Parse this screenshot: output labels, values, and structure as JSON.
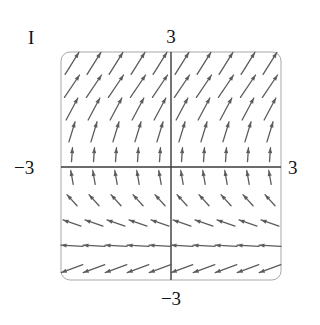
{
  "figure": {
    "title_label": "I",
    "labels": {
      "top": "3",
      "bottom": "−3",
      "left": "−3",
      "right": "3"
    },
    "frame": {
      "x": 61,
      "y": 52,
      "width": 220,
      "height": 228,
      "corner_radius": 9,
      "stroke": "#a8a8a8",
      "stroke_width": 1
    },
    "axes": {
      "x_axis_y": 167,
      "y_axis_x": 171,
      "stroke": "#3a3a3a",
      "stroke_width": 1.4
    },
    "arrow_style": {
      "stroke": "#5c5c5c",
      "stroke_width": 1.3,
      "head_length": 5.5,
      "head_width": 4.2
    }
  },
  "chart_data": {
    "type": "scatter",
    "title": "I",
    "subtype": "direction-field",
    "xlabel": "",
    "ylabel": "",
    "xlim": [
      -3,
      3
    ],
    "ylim": [
      -3,
      3
    ],
    "grid": false,
    "legend": null,
    "tick_labels": {
      "top": "3",
      "bottom": "-3",
      "left": "-3",
      "right": "3"
    },
    "grid_columns": 10,
    "grid_rows": 10,
    "x": [
      -2.7,
      -2.1,
      -1.5,
      -0.9,
      -0.3,
      0.3,
      0.9,
      1.5,
      2.1,
      2.7
    ],
    "y": [
      2.7,
      2.1,
      1.5,
      0.9,
      0.3,
      -0.3,
      -0.9,
      -1.5,
      -2.1,
      -2.7
    ],
    "rows": [
      {
        "y": 2.7,
        "angle_deg": 58,
        "length": 26
      },
      {
        "y": 2.1,
        "angle_deg": 56,
        "length": 27
      },
      {
        "y": 1.5,
        "angle_deg": 62,
        "length": 25
      },
      {
        "y": 0.9,
        "angle_deg": 73,
        "length": 21
      },
      {
        "y": 0.3,
        "angle_deg": 86,
        "length": 14
      },
      {
        "y": -0.3,
        "angle_deg": 100,
        "length": 14
      },
      {
        "y": -0.9,
        "angle_deg": 132,
        "length": 15
      },
      {
        "y": -1.5,
        "angle_deg": 161,
        "length": 19
      },
      {
        "y": -2.1,
        "angle_deg": 177,
        "length": 22
      },
      {
        "y": -2.7,
        "angle_deg": 200,
        "length": 23
      }
    ]
  }
}
